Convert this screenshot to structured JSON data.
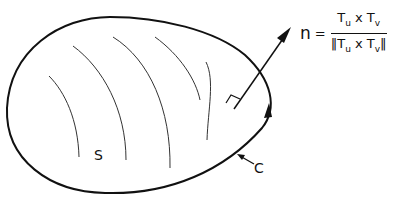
{
  "diagram": {
    "surface_label": "S",
    "curve_label": "C",
    "normal_symbol": "n",
    "equals": "=",
    "numerator": {
      "a": "T",
      "a_sub": "u",
      "op": " x ",
      "b": "T",
      "b_sub": "v"
    },
    "denominator": {
      "open": "‖",
      "a": "T",
      "a_sub": "u",
      "op": " x ",
      "b": "T",
      "b_sub": "v",
      "close": "‖"
    },
    "stroke_color": "#111111",
    "background": "#ffffff"
  }
}
